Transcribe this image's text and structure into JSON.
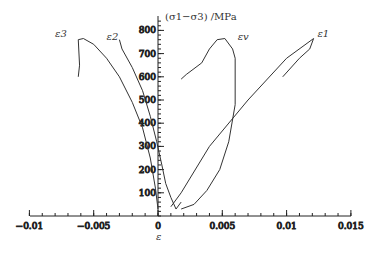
{
  "chart_data": {
    "type": "line",
    "title": "",
    "xlabel": "ε",
    "ylabel": "(σ1−σ3) /MPa",
    "xlim": [
      -0.01,
      0.015
    ],
    "ylim": [
      0,
      850
    ],
    "grid": false,
    "legend": "inline curve labels",
    "x_ticks": [
      "-0.01",
      "-0.005",
      "0",
      "0.005",
      "0.01",
      "0.015"
    ],
    "y_ticks": [
      "100",
      "200",
      "300",
      "400",
      "500",
      "600",
      "700",
      "800"
    ],
    "series": [
      {
        "name": "ε3",
        "x": [
          -0.0062,
          -0.0061,
          -0.0062,
          -0.0058,
          -0.005,
          -0.004,
          -0.003,
          -0.002,
          -0.0012,
          -0.0006,
          -0.0002,
          0.0
        ],
        "y": [
          600,
          650,
          760,
          765,
          740,
          680,
          600,
          490,
          380,
          250,
          120,
          30
        ]
      },
      {
        "name": "ε2",
        "x": [
          -0.003,
          -0.0028,
          -0.002,
          -0.0012,
          -0.0006,
          -0.0001,
          0.0003,
          0.0006,
          0.001,
          0.0014,
          0.0018
        ],
        "y": [
          760,
          720,
          640,
          540,
          430,
          320,
          220,
          140,
          80,
          30,
          60
        ]
      },
      {
        "name": "εv",
        "x": [
          0.0018,
          0.0022,
          0.0034,
          0.004,
          0.0046,
          0.0052,
          0.0058,
          0.006,
          0.006,
          0.0055,
          0.0048,
          0.0038,
          0.0028,
          0.0018
        ],
        "y": [
          590,
          610,
          660,
          720,
          760,
          765,
          720,
          680,
          480,
          320,
          200,
          110,
          50,
          30
        ]
      },
      {
        "name": "ε1",
        "x": [
          0.001,
          0.0018,
          0.004,
          0.007,
          0.01,
          0.0121,
          0.0118,
          0.011,
          0.0097
        ],
        "y": [
          40,
          100,
          300,
          500,
          680,
          765,
          720,
          680,
          600
        ]
      }
    ],
    "annotations": [
      "ε3",
      "ε2",
      "εv",
      "ε1"
    ]
  }
}
